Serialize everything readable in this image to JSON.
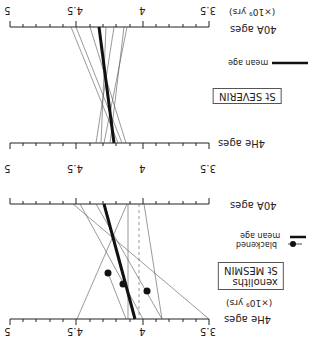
{
  "orientation": "rotated 180 degrees",
  "panels": [
    {
      "title": "St SEVERIN",
      "top_axis_label": "40A ages",
      "top_axis_unit": "(×10⁹ yrs)",
      "bottom_axis_label": "4He ages",
      "ticks": [
        "5",
        "4.5",
        "4",
        "3.5"
      ],
      "legend": [
        {
          "label": "mean age",
          "style": "thick"
        }
      ]
    },
    {
      "title_line1": "St MESMIN",
      "title_line2": "xenoliths",
      "top_axis_label": "40A ages",
      "bottom_axis_label": "4He ages",
      "bottom_axis_unit": "(×10⁹ yrs)",
      "ticks": [
        "5",
        "4.5",
        "4",
        "3.5"
      ],
      "legend": [
        {
          "label": "mean age",
          "style": "thick"
        },
        {
          "label": "blackened",
          "style": "dot"
        }
      ]
    }
  ]
}
